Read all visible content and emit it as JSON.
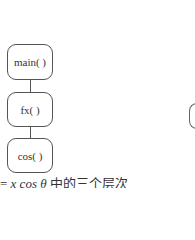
{
  "diagram": {
    "type": "call-stack-hierarchy",
    "nodes": [
      {
        "id": "main",
        "label": "main( )"
      },
      {
        "id": "fx",
        "label": "fx( )"
      },
      {
        "id": "cos",
        "label": "cos( )"
      }
    ],
    "edges": [
      {
        "from": "main",
        "to": "fx"
      },
      {
        "from": "fx",
        "to": "cos"
      }
    ],
    "caption": {
      "prefix": "= ",
      "math": "x cos θ",
      "suffix": " 中的三个层次"
    },
    "colors": {
      "stroke": "#555555",
      "text": "#333333",
      "background": "#ffffff"
    }
  }
}
